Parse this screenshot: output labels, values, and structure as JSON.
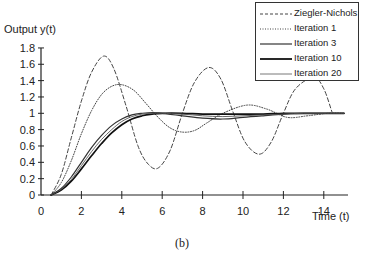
{
  "chart_data": {
    "type": "line",
    "title": "",
    "caption": "(b)",
    "xlabel": "Time (t)",
    "ylabel": "Output y(t)",
    "xlim": [
      0,
      15.2
    ],
    "ylim": [
      0,
      1.8
    ],
    "xticks": [
      0,
      2,
      4,
      6,
      8,
      10,
      12,
      14
    ],
    "yticks": [
      0,
      0.2,
      0.4,
      0.6,
      0.8,
      1,
      1.2,
      1.4,
      1.6,
      1.8
    ],
    "ytick_labels": [
      "0",
      "0.2",
      "0.4",
      "0.6",
      "0.8",
      "1",
      "1.2",
      "1.4",
      "1.6",
      "1.8"
    ],
    "grid": false,
    "legend_position": "upper right",
    "series": [
      {
        "name": "Ziegler-Nichols",
        "style": "dashed",
        "x": [
          0.5,
          1.0,
          1.5,
          2.0,
          2.5,
          3.1,
          3.6,
          4.2,
          4.8,
          5.3,
          5.8,
          6.4,
          7.0,
          7.6,
          8.3,
          8.9,
          9.5,
          10.1,
          10.8,
          11.4,
          12.0,
          12.6,
          13.5,
          14.0,
          14.4
        ],
        "y": [
          0.0,
          0.25,
          0.7,
          1.15,
          1.5,
          1.7,
          1.55,
          1.1,
          0.6,
          0.38,
          0.33,
          0.55,
          1.0,
          1.38,
          1.56,
          1.42,
          1.02,
          0.65,
          0.5,
          0.65,
          1.0,
          1.3,
          1.44,
          1.3,
          1.02
        ]
      },
      {
        "name": "Iteration 1",
        "style": "dotted",
        "x": [
          0.5,
          1.0,
          1.5,
          2.0,
          2.5,
          3.0,
          3.5,
          4.0,
          4.6,
          5.2,
          5.8,
          6.4,
          7.0,
          7.6,
          8.2,
          9.0,
          10.2,
          11.2,
          12.2,
          13.2,
          14.2,
          15.0
        ],
        "y": [
          0.0,
          0.15,
          0.42,
          0.75,
          1.03,
          1.23,
          1.33,
          1.35,
          1.28,
          1.12,
          0.95,
          0.82,
          0.77,
          0.79,
          0.88,
          1.0,
          1.1,
          1.05,
          0.95,
          0.97,
          1.0,
          1.0
        ]
      },
      {
        "name": "Iteration 3",
        "style": "solid",
        "x": [
          0.5,
          1.0,
          1.5,
          2.0,
          2.5,
          3.0,
          3.5,
          4.0,
          4.5,
          5.0,
          5.5,
          6.0,
          7.0,
          8.0,
          9.0,
          10.0,
          11.0,
          12.0,
          13.0,
          14.0,
          15.0
        ],
        "y": [
          0.0,
          0.08,
          0.22,
          0.4,
          0.58,
          0.73,
          0.85,
          0.93,
          0.98,
          1.0,
          1.01,
          1.0,
          0.97,
          0.94,
          0.93,
          0.95,
          0.97,
          0.99,
          1.0,
          1.0,
          1.0
        ]
      },
      {
        "name": "Iteration 10",
        "style": "solid-bold",
        "x": [
          0.5,
          1.0,
          1.5,
          2.0,
          2.5,
          3.0,
          3.5,
          4.0,
          4.5,
          5.0,
          5.5,
          6.0,
          7.0,
          8.0,
          9.0,
          10.0,
          11.0,
          12.0,
          13.0,
          14.0,
          15.0
        ],
        "y": [
          0.0,
          0.06,
          0.17,
          0.32,
          0.48,
          0.63,
          0.76,
          0.86,
          0.93,
          0.97,
          0.99,
          1.0,
          1.0,
          0.99,
          0.99,
          0.99,
          0.99,
          1.0,
          1.0,
          1.0,
          1.0
        ]
      },
      {
        "name": "Iteration 20",
        "style": "solid-thin",
        "x": [
          0.5,
          1.0,
          1.5,
          2.0,
          2.5,
          3.0,
          3.5,
          4.0,
          4.5,
          5.0,
          5.5,
          6.0,
          7.0,
          8.0,
          9.0,
          10.0,
          11.0,
          12.0,
          13.0,
          14.0,
          15.0
        ],
        "y": [
          0.0,
          0.07,
          0.19,
          0.36,
          0.53,
          0.68,
          0.8,
          0.9,
          0.96,
          0.99,
          1.0,
          1.0,
          0.99,
          0.97,
          0.96,
          0.97,
          0.98,
          0.99,
          1.0,
          1.0,
          1.0
        ]
      }
    ]
  }
}
